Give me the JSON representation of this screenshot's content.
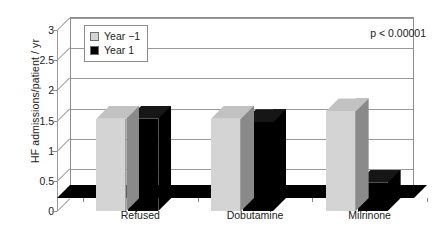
{
  "chart_data": {
    "type": "bar",
    "title": "",
    "subtitle": "",
    "xlabel": "",
    "ylabel": "HF admissions/patient / yr",
    "categories": [
      "Refused",
      "Dobutamine",
      "Milrinone"
    ],
    "series": [
      {
        "name": "Year −1",
        "color": "#d4d4d4",
        "values": [
          1.53,
          1.53,
          1.65
        ]
      },
      {
        "name": "Year 1",
        "color": "#000000",
        "values": [
          1.53,
          1.47,
          0.47
        ]
      }
    ],
    "ylim": [
      0,
      3
    ],
    "yticks": [
      0,
      0.5,
      1,
      1.5,
      2,
      2.5,
      3
    ],
    "ytick_labels": [
      "0",
      "0.5",
      "1",
      "1.5",
      "2",
      "2.5",
      "3"
    ],
    "grid": true,
    "grid_axis": "y",
    "legend_position": "upper left",
    "annotations": [
      {
        "text": "p < 0.00001",
        "position": "upper right"
      }
    ],
    "style": "3d-bar",
    "colors": {
      "series1_front": "#d4d4d4",
      "series1_side": "#8a8a8a",
      "series1_top": "#c2c2c2",
      "series2_front": "#000000",
      "series2_side": "#000000",
      "series2_top": "#161616",
      "axis": "#8c8c8c",
      "grid": "#9a9a9a",
      "text": "#1a1a1a",
      "background": "#ffffff"
    }
  },
  "legend": {
    "items": [
      {
        "label": "Year −1",
        "swatch": "#d4d4d4"
      },
      {
        "label": "Year 1",
        "swatch": "#000000"
      }
    ]
  },
  "annotation": {
    "pvalue": "p < 0.00001"
  }
}
